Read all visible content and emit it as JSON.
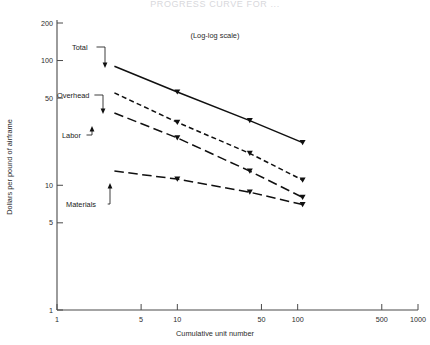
{
  "chart_data": {
    "type": "line",
    "title": "PROGRESS CURVE FOR ...",
    "annotation": "(Log-log scale)",
    "xlabel": "Cumulative unit number",
    "ylabel": "Dollars per pound of airframe",
    "xscale": "log",
    "yscale": "log",
    "xlim": [
      1,
      1000
    ],
    "ylim": [
      1,
      200
    ],
    "grid": false,
    "legend_position": "inline-labels",
    "xticks": [
      "1",
      "5",
      "10",
      "50",
      "100",
      "500",
      "1000"
    ],
    "xtick_values": [
      1,
      5,
      10,
      50,
      100,
      500,
      1000
    ],
    "yticks": [
      "1",
      "5",
      "10",
      "50",
      "100",
      "200"
    ],
    "ytick_values": [
      1,
      5,
      10,
      50,
      100,
      200
    ],
    "x": [
      3,
      10,
      40,
      110
    ],
    "series": [
      {
        "name": "Total",
        "label": "Total",
        "linestyle": "solid",
        "color": "#101010",
        "values": [
          90,
          56,
          33,
          22
        ]
      },
      {
        "name": "Overhead",
        "label": "Overhead",
        "linestyle": "dashed-short",
        "color": "#101010",
        "values": [
          55,
          32,
          18,
          11
        ]
      },
      {
        "name": "Labor",
        "label": "Labor",
        "linestyle": "dashed-long",
        "color": "#101010",
        "values": [
          38,
          24,
          13,
          8
        ]
      },
      {
        "name": "Materials",
        "label": "Materials",
        "linestyle": "dashed-long",
        "color": "#101010",
        "values": [
          13,
          11.2,
          8.8,
          7
        ]
      }
    ]
  }
}
